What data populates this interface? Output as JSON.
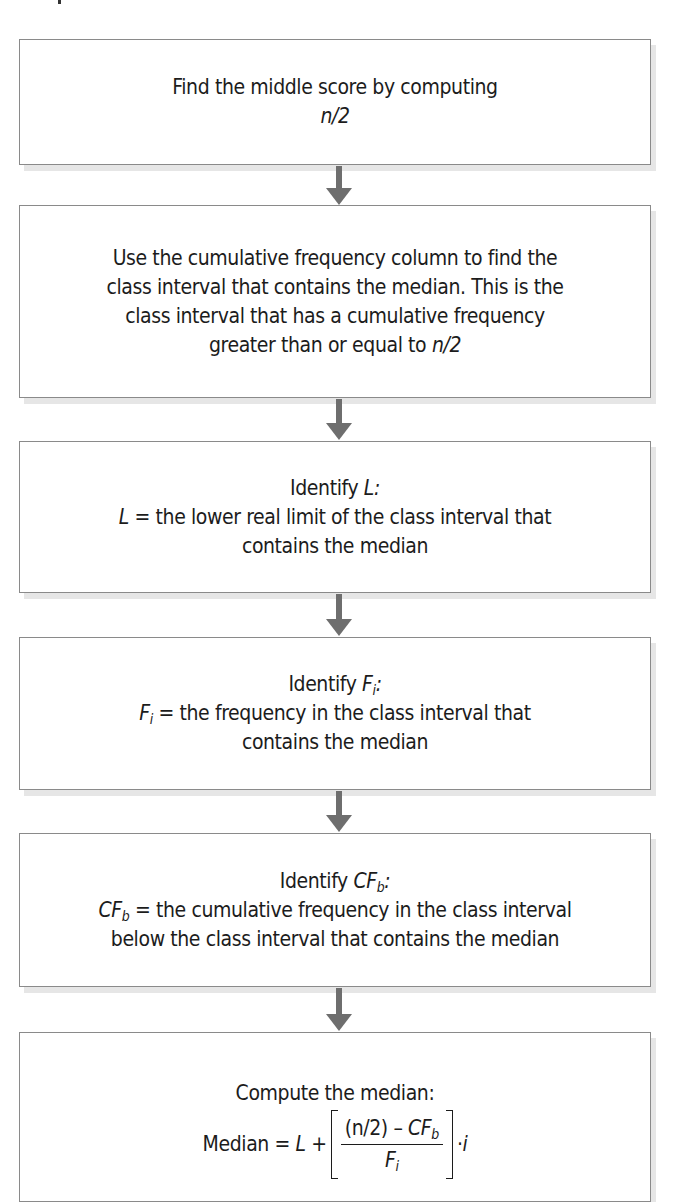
{
  "flowchart": {
    "title": "Steps for computing the median from a grouped frequency distribution",
    "steps": [
      {
        "id": "step-1",
        "lines": [
          "Find the middle score by computing"
        ],
        "math": "n/2"
      },
      {
        "id": "step-2",
        "lines": [
          "Use the cumulative frequency column to find the",
          "class interval that contains the median. This is the",
          "class interval that has a cumulative frequency",
          "greater than or equal to"
        ],
        "math": "n/2"
      },
      {
        "id": "step-3",
        "heading_prefix": "Identify",
        "symbol": "L",
        "heading_suffix": ":",
        "definition_symbol": "L",
        "definition_text": "= the lower real limit of the class interval that",
        "definition_cont": "contains the median"
      },
      {
        "id": "step-4",
        "heading_prefix": "Identify",
        "symbol": "F",
        "subscript": "i",
        "heading_suffix": ":",
        "definition_text": "= the frequency in the class interval that",
        "definition_cont": "contains the median"
      },
      {
        "id": "step-5",
        "heading_prefix": "Identify",
        "symbol": "CF",
        "subscript": "b",
        "heading_suffix": ":",
        "definition_text": "= the cumulative frequency in the class interval",
        "definition_cont": "below the class interval that contains the median"
      },
      {
        "id": "step-6",
        "heading": "Compute the median:",
        "formula": {
          "lhs": "Median =",
          "L": "L",
          "plus": "+",
          "numerator_pre": "(n/2) – ",
          "numerator_sym": "CF",
          "numerator_sub": "b",
          "denominator_sym": "F",
          "denominator_sub": "i",
          "times": "·",
          "i": "i"
        }
      }
    ],
    "connector": "down-arrow",
    "colors": {
      "border": "#8a8a8a",
      "arrow": "#6e6e6e",
      "shadow": "#e6e6e6",
      "text": "#1c1c1c"
    }
  }
}
